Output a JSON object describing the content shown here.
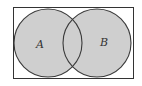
{
  "diagram": {
    "type": "venn",
    "universe": {
      "x": 13,
      "y": 7,
      "width": 120,
      "height": 71,
      "stroke": "#333333",
      "fill": "#ffffff"
    },
    "sets": [
      {
        "label": "A",
        "cx": 48,
        "cy": 43,
        "r": 34,
        "label_x": 36,
        "label_y": 48,
        "fill": "#cfcfcf"
      },
      {
        "label": "B",
        "cx": 97,
        "cy": 43,
        "r": 34,
        "label_x": 100,
        "label_y": 46,
        "fill": "#cfcfcf"
      }
    ],
    "shaded_region": "A ∪ B",
    "stroke_color": "#3a3a3a"
  }
}
